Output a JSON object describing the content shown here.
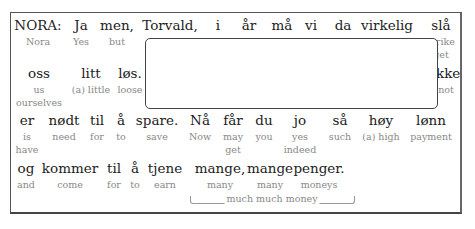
{
  "rows": [
    {
      "words": [
        {
          "text": "NORA:",
          "gloss": "Nora",
          "x": 38
        },
        {
          "text": "Ja",
          "gloss": "Yes",
          "x": 81
        },
        {
          "text": "men,",
          "gloss": "but",
          "x": 117
        },
        {
          "text": "Torvald,",
          "gloss": "",
          "x": 170
        },
        {
          "text": "i",
          "gloss": "",
          "x": 218
        },
        {
          "text": "år",
          "gloss": "",
          "x": 249
        },
        {
          "text": "må",
          "gloss": "",
          "x": 282
        },
        {
          "text": "vi",
          "gloss": "",
          "x": 311
        },
        {
          "text": "da",
          "gloss": "",
          "x": 343
        },
        {
          "text": "virkelig",
          "gloss": "",
          "x": 387
        },
        {
          "text": "slå",
          "gloss": "strike",
          "gloss2": "get",
          "x": 441
        }
      ]
    },
    {
      "words": [
        {
          "text": "oss",
          "gloss": "us",
          "gloss2": "ourselves",
          "x": 39
        },
        {
          "text": "litt",
          "gloss": "(a) little",
          "x": 91
        },
        {
          "text": "løs.",
          "gloss": "loose",
          "x": 130
        },
        {
          "text": "ikke",
          "gloss": "not",
          "x": 446
        }
      ]
    },
    {
      "words": [
        {
          "text": "er",
          "gloss": "is",
          "gloss2": "have",
          "x": 27
        },
        {
          "text": "nødt",
          "gloss": "need",
          "x": 64
        },
        {
          "text": "til",
          "gloss": "for",
          "x": 97
        },
        {
          "text": "å",
          "gloss": "to",
          "x": 121
        },
        {
          "text": "spare.",
          "gloss": "save",
          "x": 157
        },
        {
          "text": "Nå",
          "gloss": "Now",
          "x": 200
        },
        {
          "text": "får",
          "gloss": "may",
          "gloss2": "get",
          "x": 233
        },
        {
          "text": "du",
          "gloss": "you",
          "x": 264
        },
        {
          "text": "jo",
          "gloss": "yes",
          "gloss2": "indeed",
          "x": 300
        },
        {
          "text": "så",
          "gloss": "such",
          "x": 340
        },
        {
          "text": "høy",
          "gloss": "(a) high",
          "x": 381
        },
        {
          "text": "lønn",
          "gloss": "payment",
          "x": 431
        }
      ]
    },
    {
      "words": [
        {
          "text": "og",
          "gloss": "and",
          "x": 26
        },
        {
          "text": "kommer",
          "gloss": "come",
          "x": 70
        },
        {
          "text": "til",
          "gloss": "for",
          "x": 114
        },
        {
          "text": "å",
          "gloss": "to",
          "x": 135
        },
        {
          "text": "tjene",
          "gloss": "earn",
          "x": 165
        },
        {
          "text": "mange,",
          "gloss": "many",
          "x": 220
        },
        {
          "text": "mange",
          "gloss": "many",
          "x": 270
        },
        {
          "text": "penger.",
          "gloss": "moneys",
          "x": 319
        }
      ]
    }
  ],
  "phrase_gloss": {
    "text": "much much money"
  },
  "popup": {
    "visible": true,
    "content": ""
  }
}
